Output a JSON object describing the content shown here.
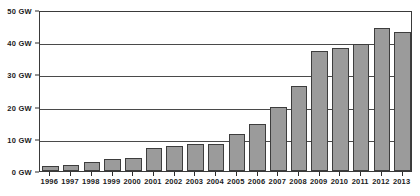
{
  "chart_data": {
    "type": "bar",
    "title": "",
    "subtitle": "",
    "xlabel": "",
    "ylabel": "",
    "unit": "GW",
    "grid": true,
    "legend": "none",
    "ylim": [
      0,
      50
    ],
    "ytick_values": [
      0,
      10,
      20,
      30,
      40,
      50
    ],
    "ytick_labels": [
      "0 GW",
      "10 GW",
      "20 GW",
      "30 GW",
      "40 GW",
      "50 GW"
    ],
    "categories": [
      "1996",
      "1997",
      "1998",
      "1999",
      "2000",
      "2001",
      "2002",
      "2003",
      "2004",
      "2005",
      "2006",
      "2007",
      "2008",
      "2009",
      "2010",
      "2011",
      "2012",
      "2013"
    ],
    "values": [
      1.6,
      2.0,
      2.9,
      3.7,
      4.0,
      7.1,
      7.9,
      8.4,
      8.5,
      11.5,
      14.6,
      20.0,
      26.3,
      37.4,
      38.1,
      39.4,
      44.3,
      43.3
    ],
    "bar_color": "#9b9b9b",
    "bar_border_color": "#3d3d3d",
    "axis_color": "#3a3a3a",
    "grid_color": "#4a4a4a",
    "text_color": "#1b1b1b",
    "background_color": "#ffffff"
  }
}
